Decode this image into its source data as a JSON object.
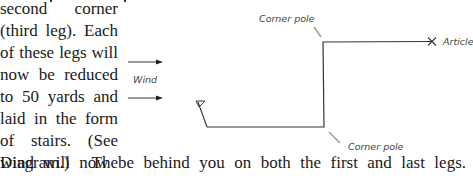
{
  "document": {
    "column_lines": [
      "second corner",
      "(third leg). Each",
      "of these legs will",
      "now be reduced",
      "to 50 yards and",
      "laid in the form",
      "of stairs. (See",
      "Diagram.) The"
    ],
    "full_width_line": "wind will now be behind you on both the first and last legs."
  },
  "diagram": {
    "wind_label": "Wind",
    "corner_pole_top_label": "Corner pole",
    "corner_pole_bottom_label": "Corner pole",
    "article_label": "Article",
    "line_color": "#333333",
    "leader_color": "#9a9a9a"
  }
}
